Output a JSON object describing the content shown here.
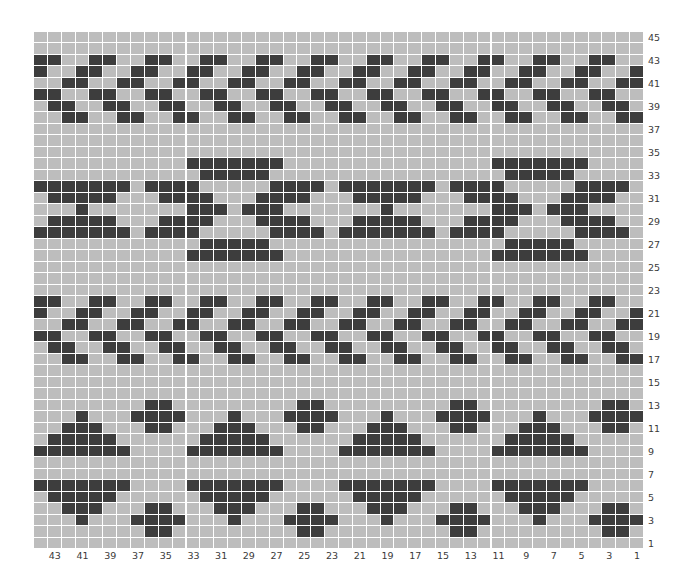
{
  "chart_data": {
    "type": "heatmap",
    "title": "",
    "columns": 44,
    "rows_count": 45,
    "column_numbering": "right-to-left, 1 at right edge",
    "row_numbering": "bottom-to-top, 1 at bottom",
    "legend": {
      "dark": "#3d3d3d",
      "light": "#bdbdbd",
      "gridline": "#ffffff"
    },
    "row_labels": [
      "45",
      "43",
      "41",
      "39",
      "37",
      "35",
      "33",
      "31",
      "29",
      "27",
      "25",
      "23",
      "21",
      "19",
      "17",
      "15",
      "13",
      "11",
      "9",
      "7",
      "5",
      "3",
      "1"
    ],
    "column_labels": [
      "43",
      "41",
      "39",
      "37",
      "35",
      "33",
      "31",
      "29",
      "27",
      "25",
      "23",
      "21",
      "19",
      "17",
      "15",
      "13",
      "11",
      "9",
      "7",
      "5",
      "3",
      "1"
    ],
    "grid_rows_top_to_bottom": [
      "............................................",
      "............................................",
      "##..##..##..##..##..##..##..##..##..##..##..",
      "#..##..##..##..##..##..##..##..##..##..##..#",
      "..##..##..##..##..##..##..##..##..##..##..##",
      "##..##..##..##..##..##..##..##..##..##..##..",
      ".##..##..##..##..##..##..##..##..##..##..##.",
      "..##..##..##..##..##..##..##..##..##..##..##",
      "............................................",
      "............................................",
      "............................................",
      "...........#######...............#######....",
      "............#####.................#####.....",
      "#######.####.....####.#######.####.....####.",
      ".#####...####...####...#####...####...####..",
      "...#.......###.###.......#.......###.###....",
      ".#####...####...####...#####...####...####..",
      "#######.####.....####.#######.####.....####.",
      "............#####.................#####.....",
      "...........#######...............#######....",
      "............................................",
      "............................................",
      "............................................",
      "##..##..##..##..##..##..##..##..##..##..##..",
      "#..##..##..##..##..##..##..##..##..##..##..#",
      "..##..##..##..##..##..##..##..##..##..##..##",
      "##..##..##..##..##..##..##..##..##..##..##..",
      ".##..##..##..##..##..##..##..##..##..##..##.",
      "..##..##..##..##..##..##..##..##..##..##..##",
      "............................................",
      "............................................",
      "............................................",
      "........##.........##.........##.........##.",
      "...#...####...#...####...#...####...#...####",
      "..###...##...###...##...###...##...###...##.",
      ".#####......#####......#####......#####.....",
      "#######....#######....#######....#######....",
      "............................................",
      "............................................",
      "#######....#######....#######....#######....",
      ".#####......#####......#####......#####.....",
      "..###...##...###...##...###...##...###...##.",
      "...#...####...#...####...#...####...#...####",
      "........##.........##.........##.........##.",
      "............................................"
    ]
  }
}
